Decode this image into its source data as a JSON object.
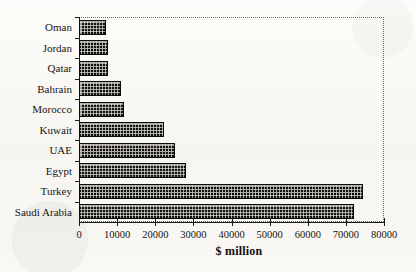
{
  "chart_data": {
    "type": "bar",
    "orientation": "horizontal",
    "title": "",
    "subtitle": "",
    "xlabel": "$ million",
    "ylabel": "",
    "categories": [
      "Saudi Arabia",
      "Turkey",
      "Egypt",
      "UAE",
      "Kuwait",
      "Morocco",
      "Bahrain",
      "Qatar",
      "Jordan",
      "Oman"
    ],
    "values": [
      72000,
      74400,
      28000,
      25200,
      22300,
      11800,
      11000,
      7600,
      7600,
      7100
    ],
    "display_order_top_to_bottom": [
      "Oman",
      "Jordan",
      "Qatar",
      "Bahrain",
      "Morocco",
      "Kuwait",
      "UAE",
      "Egypt",
      "Turkey",
      "Saudi Arabia"
    ],
    "bars": [
      {
        "label": "Oman",
        "value": 7100
      },
      {
        "label": "Jordan",
        "value": 7600
      },
      {
        "label": "Qatar",
        "value": 7600
      },
      {
        "label": "Bahrain",
        "value": 11000
      },
      {
        "label": "Morocco",
        "value": 11800
      },
      {
        "label": "Kuwait",
        "value": 22300
      },
      {
        "label": "UAE",
        "value": 25200
      },
      {
        "label": "Egypt",
        "value": 28000
      },
      {
        "label": "Turkey",
        "value": 74400
      },
      {
        "label": "Saudi Arabia",
        "value": 72000
      }
    ],
    "xlim": [
      0,
      80000
    ],
    "xticks": [
      0,
      10000,
      20000,
      30000,
      40000,
      50000,
      60000,
      70000,
      80000
    ],
    "xtick_labels": [
      "0",
      "10000",
      "20000",
      "30000",
      "40000",
      "50000",
      "60000",
      "70000",
      "80000"
    ],
    "grid": false,
    "legend": null,
    "series_color": "#141210",
    "bar_fill": "cross-hatch-dotted",
    "frame_color": "#2a2724",
    "background": "#fbfaf7"
  }
}
